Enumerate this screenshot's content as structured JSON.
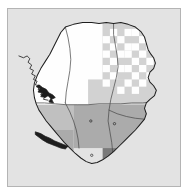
{
  "figure": {
    "kind": "choropleth-raster-map",
    "width": 189,
    "height": 196,
    "background_color": "#ffffff"
  },
  "frame": {
    "border_color": "#b4b4b4",
    "fill_color": "#e3e3e3",
    "x": 7,
    "y": 8,
    "width": 174,
    "height": 179
  },
  "palette": {
    "ocean": "#e3e3e3",
    "class_white": "#fefefe",
    "class_light": "#d2d2d2",
    "class_medium_light": "#c0c0c0",
    "class_medium": "#ababab",
    "class_medium_dark": "#9a9a9a",
    "class_dark": "#7a7a7a",
    "outline": "#1d1d1d",
    "district_boundary": "#4a4a4a",
    "stipple": "#fefefe"
  },
  "legend_classes": [
    {
      "name": "class-white",
      "color": "#fefefe"
    },
    {
      "name": "class-light",
      "color": "#d2d2d2"
    },
    {
      "name": "class-medium-light",
      "color": "#c0c0c0"
    },
    {
      "name": "class-medium",
      "color": "#ababab"
    },
    {
      "name": "class-medium-dark",
      "color": "#9a9a9a"
    },
    {
      "name": "class-dark",
      "color": "#7a7a7a"
    }
  ],
  "chart_data": {
    "type": "heatmap",
    "title": "",
    "xlabel": "",
    "ylabel": "",
    "grid_origin_x": 24,
    "grid_origin_y": 14,
    "cell_width": 8,
    "cell_height": 8,
    "grid_cols": 18,
    "grid_rows": 20,
    "legend_position": "none",
    "grid": false,
    "region_blocks": [
      {
        "name": "north-west-block",
        "x": 24,
        "y": 14,
        "w": 80,
        "h": 92,
        "class": "class-white",
        "color": "#fefefe"
      },
      {
        "name": "north-east-block",
        "x": 104,
        "y": 14,
        "w": 64,
        "h": 64,
        "class": "class-light",
        "color": "#d2d2d2"
      },
      {
        "name": "north-central-block",
        "x": 88,
        "y": 78,
        "w": 80,
        "h": 28,
        "class": "class-light",
        "color": "#d2d2d2"
      },
      {
        "name": "west-central-block",
        "x": 24,
        "y": 106,
        "w": 48,
        "h": 28,
        "class": "class-medium-light",
        "color": "#c0c0c0"
      },
      {
        "name": "south-central-block",
        "x": 72,
        "y": 106,
        "w": 96,
        "h": 48,
        "class": "class-medium",
        "color": "#ababab"
      },
      {
        "name": "south-west-block",
        "x": 24,
        "y": 134,
        "w": 48,
        "h": 40,
        "class": "class-medium",
        "color": "#ababab"
      },
      {
        "name": "south-east-dark-block",
        "x": 104,
        "y": 154,
        "w": 40,
        "h": 24,
        "class": "class-dark",
        "color": "#7a7a7a"
      }
    ],
    "stipple_cells": [
      {
        "x": 112,
        "y": 22
      },
      {
        "x": 128,
        "y": 22
      },
      {
        "x": 136,
        "y": 22
      },
      {
        "x": 104,
        "y": 30
      },
      {
        "x": 120,
        "y": 30
      },
      {
        "x": 144,
        "y": 30
      },
      {
        "x": 112,
        "y": 38
      },
      {
        "x": 128,
        "y": 38
      },
      {
        "x": 136,
        "y": 38
      },
      {
        "x": 152,
        "y": 38
      },
      {
        "x": 104,
        "y": 46
      },
      {
        "x": 120,
        "y": 46
      },
      {
        "x": 128,
        "y": 46
      },
      {
        "x": 144,
        "y": 46
      },
      {
        "x": 112,
        "y": 54
      },
      {
        "x": 136,
        "y": 54
      },
      {
        "x": 152,
        "y": 54
      },
      {
        "x": 104,
        "y": 62
      },
      {
        "x": 120,
        "y": 62
      },
      {
        "x": 128,
        "y": 62
      },
      {
        "x": 144,
        "y": 62
      },
      {
        "x": 112,
        "y": 70
      },
      {
        "x": 136,
        "y": 70
      },
      {
        "x": 152,
        "y": 70
      },
      {
        "x": 104,
        "y": 78
      },
      {
        "x": 128,
        "y": 78
      },
      {
        "x": 144,
        "y": 78
      },
      {
        "x": 120,
        "y": 86
      },
      {
        "x": 136,
        "y": 86
      }
    ],
    "point_markers": [
      {
        "name": "settlement-marker-west",
        "x": 91,
        "y": 124
      },
      {
        "name": "settlement-marker-east",
        "x": 117,
        "y": 127
      },
      {
        "name": "settlement-marker-coast",
        "x": 92,
        "y": 162
      }
    ]
  },
  "geometry": {
    "country_outline_path": "M 63 20 L 72 17 L 82 15 L 92 15 L 100 16 L 108 15 L 116 16 L 124 15 L 132 17 L 140 20 L 146 25 L 150 31 L 152 38 L 154 45 L 157 50 L 160 54 L 162 60 L 160 66 L 156 70 L 154 76 L 156 81 L 160 85 L 163 90 L 161 96 L 156 100 L 152 104 L 150 110 L 152 116 L 150 122 L 145 128 L 140 134 L 134 140 L 128 146 L 122 152 L 116 158 L 110 163 L 104 167 L 98 170 L 92 171 L 86 169 L 80 165 L 74 160 L 68 154 L 62 148 L 57 142 L 52 136 L 47 130 L 42 124 L 38 118 L 34 112 L 31 105 L 29 98 L 28 90 L 29 82 L 32 74 L 36 66 L 41 58 L 46 50 L 50 42 L 54 34 L 58 26 Z",
    "coast_detail_path": "M 12 52 L 17 54 L 21 52 L 24 55 L 22 59 L 26 62 L 24 66 L 28 68 L 26 72 L 30 74 L 28 78 L 32 80 L 30 84 L 35 85 L 33 89 L 38 91 L 36 95 L 41 96 L 39 100 L 44 101",
    "estuary_path": "M 31 86 L 35 88 L 33 92 L 38 93 L 36 97 L 41 98 L 44 96 L 47 99 L 45 103 L 50 104 L 48 100 L 52 98 L 49 95 L 45 93 L 42 89 L 38 87 L 34 84 Z",
    "peninsula_path": "M 30 136 L 36 138 L 41 141 L 46 143 L 51 146 L 56 148 L 61 150 L 66 152 L 63 155 L 58 154 L 53 152 L 48 150 L 43 148 L 38 145 L 34 142 L 30 139 Z",
    "district_boundaries": [
      {
        "name": "boundary-north-south",
        "path": "M 29 104 L 40 104 L 52 105 L 64 106 L 76 106 L 88 106 L 100 105 L 112 105 L 124 105 L 136 104 L 148 104 L 158 103"
      },
      {
        "name": "boundary-east-central",
        "path": "M 116 16 L 116 28 L 118 40 L 120 52 L 121 64 L 119 76 L 116 88 L 113 100 L 111 112 L 110 124 L 112 136 L 114 148 L 115 158"
      },
      {
        "name": "boundary-north-west",
        "path": "M 63 20 L 66 32 L 68 44 L 69 56 L 68 68 L 66 80 L 64 92 L 63 104"
      },
      {
        "name": "boundary-south-east",
        "path": "M 111 112 L 120 116 L 130 119 L 140 121 L 150 122"
      },
      {
        "name": "boundary-south-west",
        "path": "M 63 104 L 68 114 L 72 124 L 75 134 L 77 144 L 78 154"
      }
    ]
  }
}
